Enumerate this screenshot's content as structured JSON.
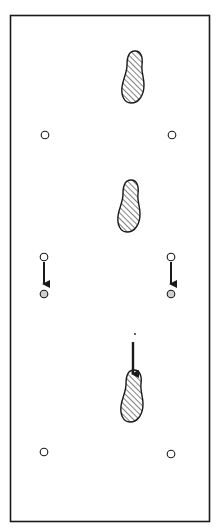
{
  "diagram": {
    "title": "",
    "frame": {
      "x": 10,
      "y": 15,
      "width": 200,
      "height": 507,
      "stroke": "#1a1a1a"
    },
    "colors": {
      "ink": "#1a1a1a",
      "paper": "#ffffff",
      "hatch_fill": "#ffffff",
      "moved_marker_fill": "#cfcfcf"
    },
    "footprints": [
      {
        "id": "footprint-top",
        "cx": 133,
        "cy": 77
      },
      {
        "id": "footprint-middle",
        "cx": 129,
        "cy": 206
      },
      {
        "id": "footprint-bottom",
        "cx": 132,
        "cy": 396
      }
    ],
    "markers": [
      {
        "id": "marker-row1-left",
        "cx": 45,
        "cy": 135,
        "filled": false
      },
      {
        "id": "marker-row1-right",
        "cx": 172,
        "cy": 135,
        "filled": false
      },
      {
        "id": "marker-row2-left-start",
        "cx": 44,
        "cy": 257,
        "filled": false
      },
      {
        "id": "marker-row2-left-end",
        "cx": 44,
        "cy": 294,
        "filled": true
      },
      {
        "id": "marker-row2-right-start",
        "cx": 171,
        "cy": 257,
        "filled": false
      },
      {
        "id": "marker-row2-right-end",
        "cx": 171,
        "cy": 294,
        "filled": true
      },
      {
        "id": "marker-row3-left",
        "cx": 44,
        "cy": 452,
        "filled": false
      },
      {
        "id": "marker-row3-right",
        "cx": 171,
        "cy": 454,
        "filled": false
      }
    ],
    "arrows": [
      {
        "id": "arrow-left-marker",
        "x": 44,
        "y1": 263,
        "y2": 288
      },
      {
        "id": "arrow-right-marker",
        "x": 171,
        "y1": 263,
        "y2": 288
      },
      {
        "id": "arrow-into-footprint",
        "x": 133,
        "y1": 342,
        "y2": 380
      }
    ],
    "annotations": [
      {
        "id": "small-dot",
        "cx": 135,
        "cy": 334
      }
    ]
  }
}
